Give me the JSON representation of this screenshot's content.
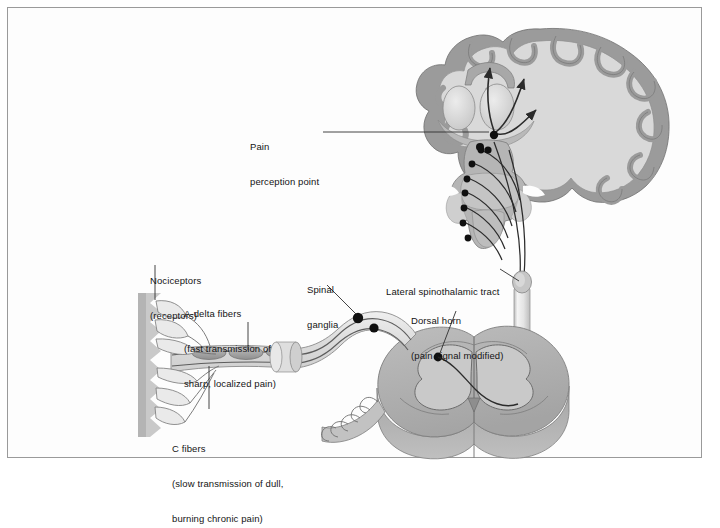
{
  "figure": {
    "border_color": "#9a9a9a",
    "background_color": "#ffffff"
  },
  "palette": {
    "line": "#3a3a3a",
    "text": "#141414",
    "cortex_ribbon": "#9b9b9b",
    "white_matter": "#d9d9d9",
    "brain_outline": "#7d7d7d",
    "thalamus": "#cfcfcf",
    "brainstem": "#b5b5b5",
    "cord_gray_matter": "#c4c4c4",
    "cord_white_matter": "#a8a8a8",
    "cord_side": "#989898",
    "nerve_fill": "#e3e3e3",
    "nociceptor_band": "#c9c9c9",
    "ganglion_dot": "#101010",
    "tract_tube": "#ececec"
  },
  "labels": [
    {
      "id": "pain-perception-point",
      "name": "label-pain-perception-point",
      "lines": [
        "Pain",
        "perception point"
      ],
      "x": 250,
      "y": 118
    },
    {
      "id": "nociceptors",
      "name": "label-nociceptors",
      "lines": [
        "Nociceptors",
        "(receptors)"
      ],
      "x": 150,
      "y": 252
    },
    {
      "id": "a-delta-fibers",
      "name": "label-a-delta-fibers",
      "lines": [
        "A-delta fibers",
        "(fast transmission of",
        "sharp, localized pain)"
      ],
      "x": 184,
      "y": 285
    },
    {
      "id": "c-fibers",
      "name": "label-c-fibers",
      "lines": [
        "C fibers",
        "(slow transmission of dull,",
        "burning chronic pain)"
      ],
      "x": 172,
      "y": 420
    },
    {
      "id": "spinal-ganglia",
      "name": "label-spinal-ganglia",
      "lines": [
        "Spinal",
        "ganglia"
      ],
      "x": 307,
      "y": 261
    },
    {
      "id": "lateral-spinothalamic-tract",
      "name": "label-lateral-spinothalamic-tract",
      "lines": [
        "Lateral spinothalamic tract"
      ],
      "x": 386,
      "y": 263
    },
    {
      "id": "dorsal-horn",
      "name": "label-dorsal-horn",
      "lines": [
        "Dorsal horn",
        "(pain signal modified)"
      ],
      "x": 411,
      "y": 292
    }
  ],
  "anatomy": {
    "brain": {
      "name": "cerebral-hemisphere-coronal-section",
      "description": "Coronal section of cerebrum with gyri, sulci, cortical ribbon, thalamus and internal capsule"
    },
    "thalamus": {
      "name": "thalamus",
      "description": "Paired oval nuclei where pain signal relays toward cortex"
    },
    "brainstem": {
      "name": "brainstem",
      "description": "Midbrain, pons and medulla with ascending nuclei dots"
    },
    "spinal_cord": {
      "name": "spinal-cord-cross-section",
      "description": "Three-dimensional cut of spinal cord showing butterfly gray matter"
    },
    "tract": {
      "name": "lateral-spinothalamic-tract-tube",
      "description": "Vertical cylinder carrying pain signal rostrally from dorsal horn to thalamus"
    },
    "nociceptors": {
      "name": "nociceptor-free-nerve-endings",
      "description": "Sawtooth band of skin with free nerve endings"
    },
    "ganglia": {
      "name": "dorsal-root-ganglia",
      "description": "Two dark cell-body dots on the peripheral nerve"
    },
    "arrows": {
      "name": "cortical-projection-arrows",
      "count": 3,
      "description": "Three arrows fanning from thalamus into cerebral cortex"
    },
    "nuclei_dots": {
      "name": "brainstem-relay-nuclei",
      "count": 6
    }
  }
}
